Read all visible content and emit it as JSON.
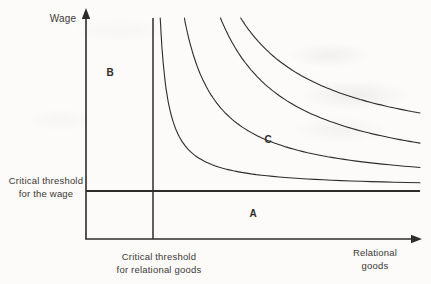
{
  "figure": {
    "bg_color": "#fcfbf9",
    "line_color": "#2e2c2a",
    "text_color": "#3b3835",
    "labels": {
      "y_axis": "Wage",
      "x_axis_line1": "Relational",
      "x_axis_line2": "goods",
      "wage_threshold_line1": "Critical threshold",
      "wage_threshold_line2": "for the wage",
      "rg_threshold_line1": "Critical threshold",
      "rg_threshold_line2": "for relational goods",
      "region_a": "A",
      "region_b": "B",
      "region_c": "C"
    }
  },
  "chart_data": {
    "type": "line",
    "xlabel": "Relational goods",
    "ylabel": "Wage",
    "grid": false,
    "legend": false,
    "axes": {
      "origin": {
        "x": 86,
        "y": 239
      },
      "x_arrow_tip": 422,
      "y_arrow_tip": 8
    },
    "thresholds": {
      "vertical": {
        "x": 153,
        "y_top": 18,
        "label": "Critical threshold for relational goods"
      },
      "horizontal": {
        "y": 191,
        "x_start": 86,
        "x_end": 420,
        "label": "Critical threshold for the wage"
      }
    },
    "curve_top_y": 18,
    "curve_right_x": 420,
    "curves": [
      {
        "name": "indifference-curve-1",
        "x_asymptote": 152,
        "y_asymptote": 188,
        "k": 1400
      },
      {
        "name": "indifference-curve-2",
        "x_asymptote": 152,
        "y_asymptote": 188,
        "k": 5500
      },
      {
        "name": "indifference-curve-3",
        "x_asymptote": 152,
        "y_asymptote": 186,
        "k": 11500
      },
      {
        "name": "indifference-curve-4",
        "x_asymptote": 152,
        "y_asymptote": 160,
        "k": 12600
      }
    ],
    "annotations": [
      {
        "label": "A",
        "x": 253,
        "y": 214
      },
      {
        "label": "B",
        "x": 110,
        "y": 73
      },
      {
        "label": "C",
        "x": 268,
        "y": 140
      }
    ]
  }
}
